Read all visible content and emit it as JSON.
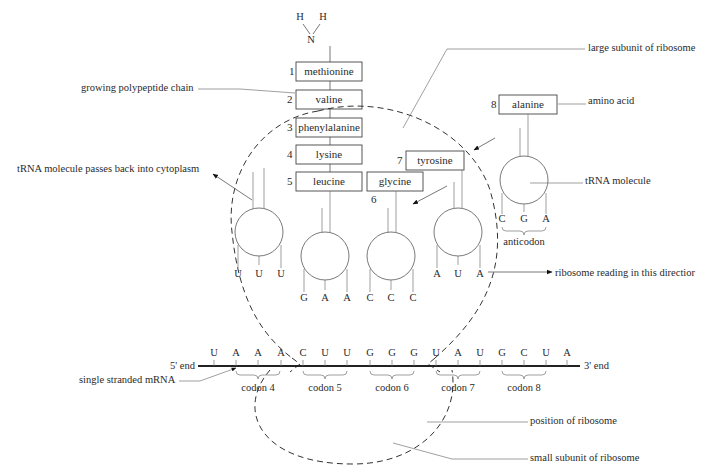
{
  "amine_group": {
    "h1": "H",
    "h2": "H",
    "n": "N"
  },
  "polypeptide": [
    {
      "num": "1",
      "name": "methionine"
    },
    {
      "num": "2",
      "name": "valine"
    },
    {
      "num": "3",
      "name": "phenylalanine"
    },
    {
      "num": "4",
      "name": "lysine"
    },
    {
      "num": "5",
      "name": "leucine"
    }
  ],
  "incoming_amino_acids": [
    {
      "num": "6",
      "name": "glycine"
    },
    {
      "num": "7",
      "name": "tyrosine"
    },
    {
      "num": "8",
      "name": "alanine"
    }
  ],
  "trnas": [
    {
      "id": "exiting",
      "anticodon": [
        "U",
        "U",
        "U"
      ]
    },
    {
      "id": "leucine",
      "anticodon": [
        "G",
        "A",
        "A"
      ]
    },
    {
      "id": "glycine",
      "anticodon": [
        "C",
        "C",
        "C"
      ]
    },
    {
      "id": "tyrosine",
      "anticodon": [
        "A",
        "U",
        "A"
      ]
    },
    {
      "id": "alanine",
      "anticodon": [
        "C",
        "G",
        "A"
      ]
    }
  ],
  "mrna": {
    "five_prime": "5' end",
    "three_prime": "3' end",
    "bases": [
      "U",
      "A",
      "A",
      "A",
      "C",
      "U",
      "U",
      "G",
      "G",
      "G",
      "U",
      "A",
      "U",
      "G",
      "C",
      "U",
      "A"
    ],
    "codons": [
      "codon 4",
      "codon 5",
      "codon 6",
      "codon 7",
      "codon 8"
    ]
  },
  "labels": {
    "growing_chain": "growing polypeptide chain",
    "large_subunit": "large subunit of ribosome",
    "amino_acid": "amino acid",
    "trna_molecule": "tRNA molecule",
    "anticodon": "anticodon",
    "trna_exits": "tRNA molecule passes back into cytoplasm",
    "reading_direction": "ribosome reading in this directior",
    "single_mrna": "single stranded mRNA",
    "position": "position of ribosome",
    "small_subunit": "small subunit of ribosome"
  }
}
